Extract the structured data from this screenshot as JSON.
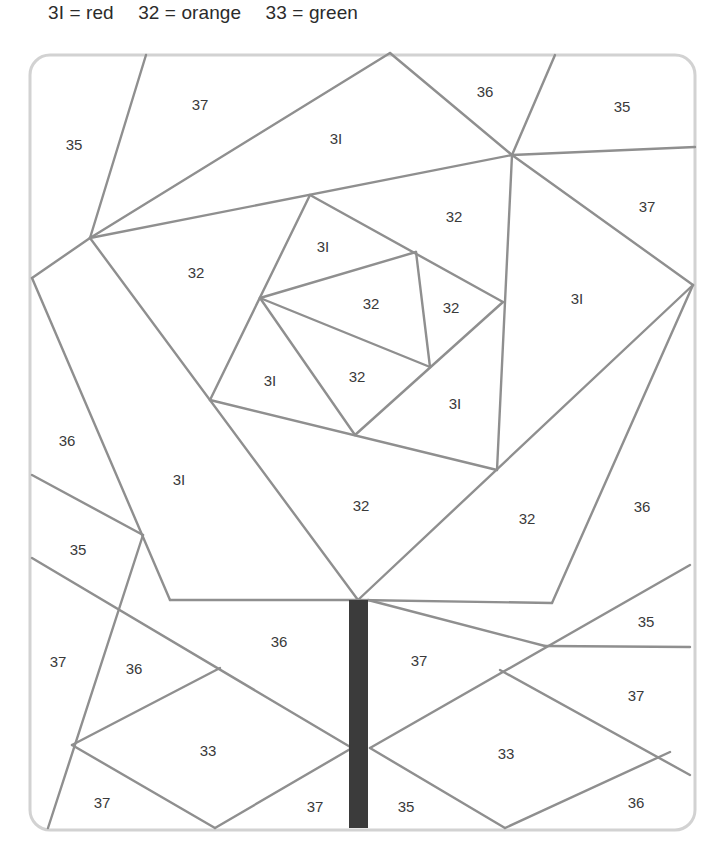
{
  "legend": {
    "items": [
      {
        "code": "31",
        "color_name": "red",
        "label": "3I = red"
      },
      {
        "code": "32",
        "color_name": "orange",
        "label": "32 = orange"
      },
      {
        "code": "33",
        "color_name": "green",
        "label": "33 = green"
      }
    ]
  },
  "colors": {
    "line": "#8f8f8f",
    "border": "#d2d2d2",
    "stem": "#3b3b3b",
    "text": "#3a3a3a",
    "background": "#ffffff"
  },
  "regions": [
    {
      "id": "r1",
      "label": "35",
      "x": 74,
      "y": 144
    },
    {
      "id": "r2",
      "label": "37",
      "x": 200,
      "y": 104
    },
    {
      "id": "r3",
      "label": "3I",
      "x": 336,
      "y": 138
    },
    {
      "id": "r4",
      "label": "36",
      "x": 485,
      "y": 91
    },
    {
      "id": "r5",
      "label": "35",
      "x": 622,
      "y": 106
    },
    {
      "id": "r6",
      "label": "37",
      "x": 647,
      "y": 206
    },
    {
      "id": "r7",
      "label": "32",
      "x": 454,
      "y": 216
    },
    {
      "id": "r8",
      "label": "3I",
      "x": 323,
      "y": 246
    },
    {
      "id": "r9",
      "label": "32",
      "x": 196,
      "y": 272
    },
    {
      "id": "r10",
      "label": "32",
      "x": 371,
      "y": 303
    },
    {
      "id": "r11",
      "label": "32",
      "x": 451,
      "y": 307
    },
    {
      "id": "r12",
      "label": "3I",
      "x": 577,
      "y": 298
    },
    {
      "id": "r13",
      "label": "3I",
      "x": 270,
      "y": 380
    },
    {
      "id": "r14",
      "label": "32",
      "x": 357,
      "y": 376
    },
    {
      "id": "r15",
      "label": "3I",
      "x": 455,
      "y": 403
    },
    {
      "id": "r16",
      "label": "36",
      "x": 67,
      "y": 440
    },
    {
      "id": "r17",
      "label": "3I",
      "x": 179,
      "y": 479
    },
    {
      "id": "r18",
      "label": "32",
      "x": 361,
      "y": 505
    },
    {
      "id": "r19",
      "label": "32",
      "x": 527,
      "y": 518
    },
    {
      "id": "r20",
      "label": "36",
      "x": 642,
      "y": 506
    },
    {
      "id": "r21",
      "label": "35",
      "x": 78,
      "y": 549
    },
    {
      "id": "r22",
      "label": "35",
      "x": 646,
      "y": 621
    },
    {
      "id": "r23",
      "label": "36",
      "x": 279,
      "y": 641
    },
    {
      "id": "r24",
      "label": "37",
      "x": 58,
      "y": 661
    },
    {
      "id": "r25",
      "label": "36",
      "x": 134,
      "y": 668
    },
    {
      "id": "r26",
      "label": "37",
      "x": 419,
      "y": 660
    },
    {
      "id": "r27",
      "label": "37",
      "x": 636,
      "y": 695
    },
    {
      "id": "r28",
      "label": "33",
      "x": 208,
      "y": 750
    },
    {
      "id": "r29",
      "label": "33",
      "x": 506,
      "y": 753
    },
    {
      "id": "r30",
      "label": "37",
      "x": 102,
      "y": 802
    },
    {
      "id": "r31",
      "label": "37",
      "x": 315,
      "y": 806
    },
    {
      "id": "r32",
      "label": "35",
      "x": 406,
      "y": 806
    },
    {
      "id": "r33",
      "label": "36",
      "x": 636,
      "y": 802
    }
  ],
  "lines": [
    [
      146,
      55,
      90,
      238
    ],
    [
      90,
      238,
      390,
      53
    ],
    [
      390,
      53,
      512,
      155
    ],
    [
      555,
      55,
      512,
      155
    ],
    [
      512,
      155,
      695,
      147
    ],
    [
      90,
      238,
      512,
      155
    ],
    [
      90,
      238,
      32,
      278
    ],
    [
      512,
      155,
      693,
      285
    ],
    [
      512,
      155,
      497,
      470
    ],
    [
      310,
      195,
      503,
      302
    ],
    [
      310,
      195,
      210,
      400
    ],
    [
      260,
      298,
      416,
      252
    ],
    [
      416,
      252,
      430,
      367
    ],
    [
      260,
      298,
      430,
      367
    ],
    [
      260,
      298,
      355,
      435
    ],
    [
      503,
      302,
      355,
      435
    ],
    [
      210,
      400,
      497,
      470
    ],
    [
      90,
      238,
      358,
      600
    ],
    [
      32,
      278,
      170,
      600
    ],
    [
      170,
      600,
      358,
      600
    ],
    [
      358,
      600,
      693,
      285
    ],
    [
      693,
      285,
      552,
      603
    ],
    [
      358,
      600,
      552,
      603
    ],
    [
      32,
      475,
      143,
      535
    ],
    [
      143,
      535,
      48,
      828
    ],
    [
      32,
      558,
      352,
      748
    ],
    [
      72,
      745,
      220,
      668
    ],
    [
      72,
      745,
      215,
      828
    ],
    [
      215,
      828,
      352,
      748
    ],
    [
      368,
      600,
      545,
      646
    ],
    [
      545,
      646,
      690,
      647
    ],
    [
      370,
      748,
      690,
      565
    ],
    [
      370,
      748,
      505,
      828
    ],
    [
      500,
      670,
      690,
      775
    ],
    [
      505,
      828,
      670,
      752
    ]
  ],
  "stem": {
    "x": 349,
    "y": 600,
    "width": 19,
    "height": 228
  },
  "border": {
    "x": 30,
    "y": 55,
    "width": 665,
    "height": 775,
    "radius": 20
  }
}
